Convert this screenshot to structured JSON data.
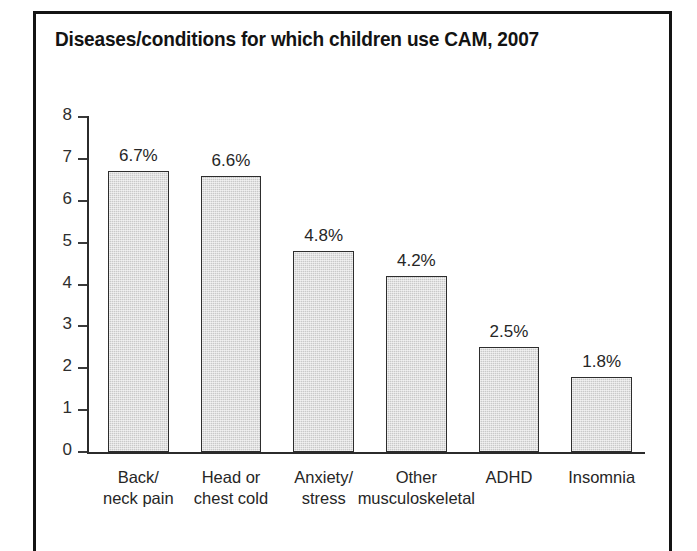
{
  "figure": {
    "title": "Diseases/conditions for which children use CAM, 2007",
    "frame_color": "#141414",
    "background": "#ffffff"
  },
  "chart_data": {
    "type": "bar",
    "title": "Diseases/conditions for which children use CAM, 2007",
    "xlabel": "",
    "ylabel": "",
    "ylim": [
      0,
      8
    ],
    "ytick_step": 1,
    "yticks": [
      "8",
      "7",
      "6",
      "5",
      "4",
      "3",
      "2",
      "1",
      "0"
    ],
    "grid": false,
    "legend": null,
    "bar_fill": "#c9c9c9",
    "bar_edge": "#2d2d2d",
    "value_suffix": "%",
    "categories": [
      "Back/\nneck pain",
      "Head or\nchest cold",
      "Anxiety/\nstress",
      "Other\nmusculoskeletal",
      "ADHD",
      "Insomnia"
    ],
    "values": [
      6.7,
      6.6,
      4.8,
      4.2,
      2.5,
      1.8
    ],
    "data_labels": [
      "6.7%",
      "6.6%",
      "4.8%",
      "4.2%",
      "2.5%",
      "1.8%"
    ]
  }
}
